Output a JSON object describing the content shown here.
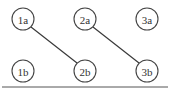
{
  "diagram": {
    "type": "node-link-graph",
    "width": 170,
    "height": 91,
    "background_color": "#ffffff",
    "node_stroke_color": "#444444",
    "node_fill_color": "#ffffff",
    "label_color": "#333333",
    "edge_color": "#3a3a3a",
    "rule_color": "#555555",
    "node_radius": 11,
    "rows": [
      {
        "name": "row-a",
        "y": 19
      },
      {
        "name": "row-b",
        "y": 71
      }
    ],
    "columns": [
      {
        "name": "column-1",
        "x": 23
      },
      {
        "name": "column-2",
        "x": 85
      },
      {
        "name": "column-3",
        "x": 147
      }
    ],
    "nodes": [
      {
        "id": "1a",
        "label": "1a",
        "x": 23,
        "y": 19,
        "r": 11
      },
      {
        "id": "2a",
        "label": "2a",
        "x": 85,
        "y": 19,
        "r": 11
      },
      {
        "id": "3a",
        "label": "3a",
        "x": 147,
        "y": 19,
        "r": 11
      },
      {
        "id": "1b",
        "label": "1b",
        "x": 23,
        "y": 71,
        "r": 11
      },
      {
        "id": "2b",
        "label": "2b",
        "x": 85,
        "y": 71,
        "r": 11
      },
      {
        "id": "3b",
        "label": "3b",
        "x": 147,
        "y": 71,
        "r": 11
      }
    ],
    "edges": [
      {
        "id": "edge-1a-2b",
        "from": "1a",
        "to": "2b",
        "x1": 31,
        "y1": 27,
        "x2": 77,
        "y2": 63
      },
      {
        "id": "edge-2a-3b",
        "from": "2a",
        "to": "3b",
        "x1": 93,
        "y1": 27,
        "x2": 139,
        "y2": 63
      }
    ],
    "bottom_rule": {
      "x1": 2,
      "y1": 87,
      "x2": 168,
      "y2": 87
    }
  }
}
